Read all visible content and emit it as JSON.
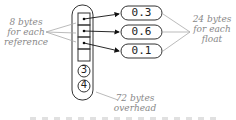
{
  "diagram": {
    "left_label": [
      "8 bytes",
      "for each",
      "reference"
    ],
    "right_label": [
      "24 bytes",
      "for each",
      "float"
    ],
    "bottom_label": [
      "72 bytes",
      "overhead"
    ],
    "array_header": [
      "3",
      "4"
    ],
    "float_values": [
      "0.3",
      "0.6",
      "0.1"
    ],
    "caption_partial": ""
  }
}
